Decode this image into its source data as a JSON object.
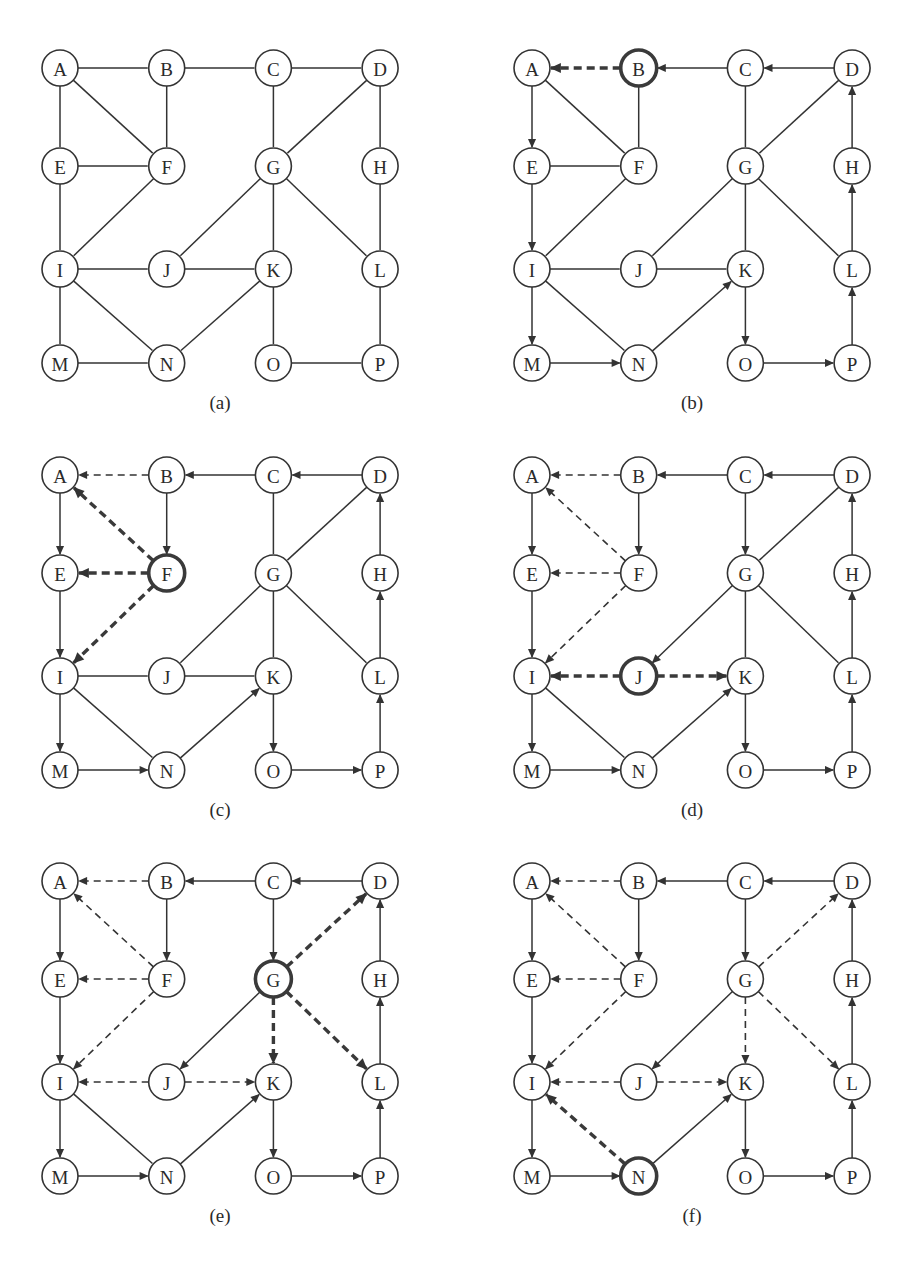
{
  "figure": {
    "node_labels": [
      "A",
      "B",
      "C",
      "D",
      "E",
      "F",
      "G",
      "H",
      "I",
      "J",
      "K",
      "L",
      "M",
      "N",
      "O",
      "P"
    ],
    "colors": {
      "stroke": "#333333",
      "background": "#ffffff"
    },
    "grid": {
      "A": [
        0,
        0
      ],
      "B": [
        1,
        0
      ],
      "C": [
        2,
        0
      ],
      "D": [
        3,
        0
      ],
      "E": [
        0,
        1
      ],
      "F": [
        1,
        1
      ],
      "G": [
        2,
        1
      ],
      "H": [
        3,
        1
      ],
      "I": [
        0,
        2
      ],
      "J": [
        1,
        2
      ],
      "K": [
        2,
        2
      ],
      "L": [
        3,
        2
      ],
      "M": [
        0,
        3
      ],
      "N": [
        1,
        3
      ],
      "O": [
        2,
        3
      ],
      "P": [
        3,
        3
      ]
    },
    "panels": [
      {
        "caption": "(a)",
        "origin": [
          60,
          68
        ],
        "current": null,
        "edges": [
          [
            "A",
            "B",
            "plain"
          ],
          [
            "B",
            "C",
            "plain"
          ],
          [
            "C",
            "D",
            "plain"
          ],
          [
            "A",
            "E",
            "plain"
          ],
          [
            "A",
            "F",
            "plain"
          ],
          [
            "B",
            "F",
            "plain"
          ],
          [
            "E",
            "F",
            "plain"
          ],
          [
            "C",
            "G",
            "plain"
          ],
          [
            "D",
            "G",
            "plain"
          ],
          [
            "D",
            "H",
            "plain"
          ],
          [
            "E",
            "I",
            "plain"
          ],
          [
            "F",
            "I",
            "plain"
          ],
          [
            "G",
            "J",
            "plain"
          ],
          [
            "G",
            "K",
            "plain"
          ],
          [
            "G",
            "L",
            "plain"
          ],
          [
            "H",
            "L",
            "plain"
          ],
          [
            "I",
            "J",
            "plain"
          ],
          [
            "J",
            "K",
            "plain"
          ],
          [
            "I",
            "M",
            "plain"
          ],
          [
            "I",
            "N",
            "plain"
          ],
          [
            "K",
            "N",
            "plain"
          ],
          [
            "K",
            "O",
            "plain"
          ],
          [
            "L",
            "P",
            "plain"
          ],
          [
            "M",
            "N",
            "plain"
          ],
          [
            "O",
            "P",
            "plain"
          ]
        ]
      },
      {
        "caption": "(b)",
        "origin": [
          532,
          68
        ],
        "current": "B",
        "edges": [
          [
            "B",
            "A",
            "hl"
          ],
          [
            "C",
            "B",
            "tree"
          ],
          [
            "D",
            "C",
            "tree"
          ],
          [
            "A",
            "E",
            "tree"
          ],
          [
            "A",
            "F",
            "plain"
          ],
          [
            "B",
            "F",
            "plain"
          ],
          [
            "E",
            "F",
            "plain"
          ],
          [
            "C",
            "G",
            "plain"
          ],
          [
            "D",
            "G",
            "plain"
          ],
          [
            "H",
            "D",
            "tree"
          ],
          [
            "E",
            "I",
            "tree"
          ],
          [
            "F",
            "I",
            "plain"
          ],
          [
            "G",
            "J",
            "plain"
          ],
          [
            "G",
            "K",
            "plain"
          ],
          [
            "G",
            "L",
            "plain"
          ],
          [
            "L",
            "H",
            "tree"
          ],
          [
            "I",
            "J",
            "plain"
          ],
          [
            "J",
            "K",
            "plain"
          ],
          [
            "I",
            "M",
            "tree"
          ],
          [
            "I",
            "N",
            "plain"
          ],
          [
            "N",
            "K",
            "tree"
          ],
          [
            "K",
            "O",
            "tree"
          ],
          [
            "P",
            "L",
            "tree"
          ],
          [
            "M",
            "N",
            "tree"
          ],
          [
            "O",
            "P",
            "tree"
          ]
        ]
      },
      {
        "caption": "(c)",
        "origin": [
          60,
          475
        ],
        "current": "F",
        "edges": [
          [
            "B",
            "A",
            "dashed"
          ],
          [
            "C",
            "B",
            "tree"
          ],
          [
            "D",
            "C",
            "tree"
          ],
          [
            "A",
            "E",
            "tree"
          ],
          [
            "F",
            "A",
            "hl"
          ],
          [
            "B",
            "F",
            "tree"
          ],
          [
            "F",
            "E",
            "hl"
          ],
          [
            "C",
            "G",
            "plain"
          ],
          [
            "D",
            "G",
            "plain"
          ],
          [
            "H",
            "D",
            "tree"
          ],
          [
            "E",
            "I",
            "tree"
          ],
          [
            "F",
            "I",
            "hl"
          ],
          [
            "G",
            "J",
            "plain"
          ],
          [
            "G",
            "K",
            "plain"
          ],
          [
            "G",
            "L",
            "plain"
          ],
          [
            "L",
            "H",
            "tree"
          ],
          [
            "I",
            "J",
            "plain"
          ],
          [
            "J",
            "K",
            "plain"
          ],
          [
            "I",
            "M",
            "tree"
          ],
          [
            "I",
            "N",
            "plain"
          ],
          [
            "N",
            "K",
            "tree"
          ],
          [
            "K",
            "O",
            "tree"
          ],
          [
            "P",
            "L",
            "tree"
          ],
          [
            "M",
            "N",
            "tree"
          ],
          [
            "O",
            "P",
            "tree"
          ]
        ]
      },
      {
        "caption": "(d)",
        "origin": [
          532,
          475
        ],
        "current": "J",
        "edges": [
          [
            "B",
            "A",
            "dashed"
          ],
          [
            "C",
            "B",
            "tree"
          ],
          [
            "D",
            "C",
            "tree"
          ],
          [
            "A",
            "E",
            "tree"
          ],
          [
            "F",
            "A",
            "dashed"
          ],
          [
            "B",
            "F",
            "tree"
          ],
          [
            "F",
            "E",
            "dashed"
          ],
          [
            "C",
            "G",
            "tree"
          ],
          [
            "D",
            "G",
            "plain"
          ],
          [
            "H",
            "D",
            "tree"
          ],
          [
            "E",
            "I",
            "tree"
          ],
          [
            "F",
            "I",
            "dashed"
          ],
          [
            "G",
            "J",
            "tree"
          ],
          [
            "G",
            "K",
            "plain"
          ],
          [
            "G",
            "L",
            "plain"
          ],
          [
            "L",
            "H",
            "tree"
          ],
          [
            "J",
            "I",
            "hl"
          ],
          [
            "J",
            "K",
            "hl"
          ],
          [
            "I",
            "M",
            "tree"
          ],
          [
            "I",
            "N",
            "plain"
          ],
          [
            "N",
            "K",
            "tree"
          ],
          [
            "K",
            "O",
            "tree"
          ],
          [
            "P",
            "L",
            "tree"
          ],
          [
            "M",
            "N",
            "tree"
          ],
          [
            "O",
            "P",
            "tree"
          ]
        ]
      },
      {
        "caption": "(e)",
        "origin": [
          60,
          881
        ],
        "current": "G",
        "edges": [
          [
            "B",
            "A",
            "dashed"
          ],
          [
            "C",
            "B",
            "tree"
          ],
          [
            "D",
            "C",
            "tree"
          ],
          [
            "A",
            "E",
            "tree"
          ],
          [
            "F",
            "A",
            "dashed"
          ],
          [
            "B",
            "F",
            "tree"
          ],
          [
            "F",
            "E",
            "dashed"
          ],
          [
            "C",
            "G",
            "tree"
          ],
          [
            "G",
            "D",
            "hl"
          ],
          [
            "H",
            "D",
            "tree"
          ],
          [
            "E",
            "I",
            "tree"
          ],
          [
            "F",
            "I",
            "dashed"
          ],
          [
            "G",
            "J",
            "tree"
          ],
          [
            "G",
            "K",
            "hl"
          ],
          [
            "G",
            "L",
            "hl"
          ],
          [
            "L",
            "H",
            "tree"
          ],
          [
            "J",
            "I",
            "dashed"
          ],
          [
            "J",
            "K",
            "dashed"
          ],
          [
            "I",
            "M",
            "tree"
          ],
          [
            "I",
            "N",
            "plain"
          ],
          [
            "N",
            "K",
            "tree"
          ],
          [
            "K",
            "O",
            "tree"
          ],
          [
            "P",
            "L",
            "tree"
          ],
          [
            "M",
            "N",
            "tree"
          ],
          [
            "O",
            "P",
            "tree"
          ]
        ]
      },
      {
        "caption": "(f)",
        "origin": [
          532,
          881
        ],
        "current": "N",
        "edges": [
          [
            "B",
            "A",
            "dashed"
          ],
          [
            "C",
            "B",
            "tree"
          ],
          [
            "D",
            "C",
            "tree"
          ],
          [
            "A",
            "E",
            "tree"
          ],
          [
            "F",
            "A",
            "dashed"
          ],
          [
            "B",
            "F",
            "tree"
          ],
          [
            "F",
            "E",
            "dashed"
          ],
          [
            "C",
            "G",
            "tree"
          ],
          [
            "G",
            "D",
            "dashed"
          ],
          [
            "H",
            "D",
            "tree"
          ],
          [
            "E",
            "I",
            "tree"
          ],
          [
            "F",
            "I",
            "dashed"
          ],
          [
            "G",
            "J",
            "tree"
          ],
          [
            "G",
            "K",
            "dashed"
          ],
          [
            "G",
            "L",
            "dashed"
          ],
          [
            "L",
            "H",
            "tree"
          ],
          [
            "J",
            "I",
            "dashed"
          ],
          [
            "J",
            "K",
            "dashed"
          ],
          [
            "I",
            "M",
            "tree"
          ],
          [
            "N",
            "I",
            "hl"
          ],
          [
            "N",
            "K",
            "tree"
          ],
          [
            "K",
            "O",
            "tree"
          ],
          [
            "P",
            "L",
            "tree"
          ],
          [
            "M",
            "N",
            "tree"
          ],
          [
            "O",
            "P",
            "tree"
          ]
        ]
      }
    ],
    "layout": {
      "dx": 106.7,
      "dy": [
        98,
        103,
        94
      ],
      "radius": 18,
      "caption_offset": 351
    }
  }
}
